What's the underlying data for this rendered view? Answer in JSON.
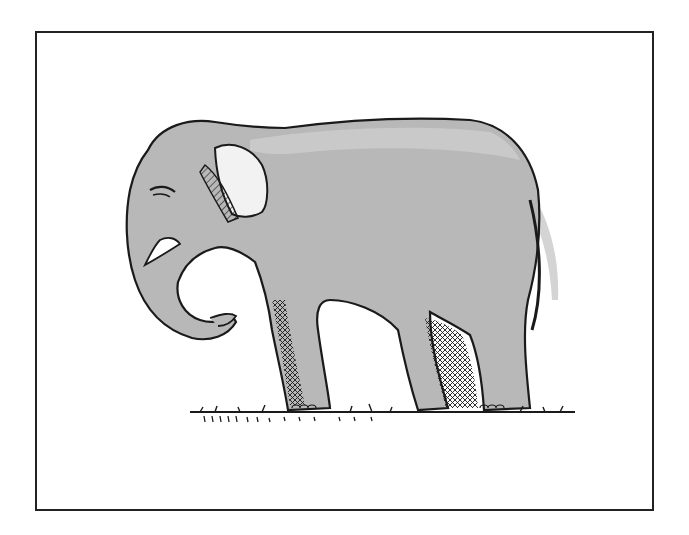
{
  "figure": {
    "colors": {
      "background": "#ffffff",
      "frame_border": "#222222",
      "body_fill": "#b8b8b8",
      "body_shadow": "#a9a9a9",
      "highlight": "#d4d4d4",
      "outline": "#1a1a1a",
      "tusk": "#ffffff"
    }
  }
}
